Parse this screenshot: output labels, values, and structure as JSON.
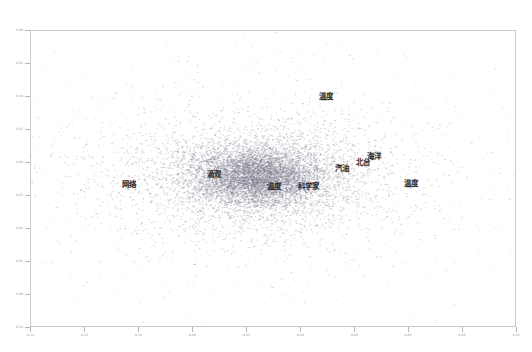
{
  "figure": {
    "background_color": "#ffffff",
    "frame_color": "#c9c9c9",
    "point_color": "#7a7a8c",
    "label_color": "#2b2b2b",
    "tick_color": "#9a9a9a"
  },
  "chart_data": {
    "type": "scatter",
    "title": "",
    "xlabel": "",
    "ylabel": "",
    "grid": false,
    "legend": null,
    "xlim": [
      -0.14,
      0.04
    ],
    "ylim": [
      -0.1,
      0.08
    ],
    "xticks": [
      -0.14,
      -0.12,
      -0.1,
      -0.08,
      -0.06,
      -0.04,
      -0.02,
      0.0,
      0.02,
      0.04
    ],
    "xticklabels": [
      "-0.14",
      "-0.12",
      "-0.10",
      "-0.08",
      "-0.06",
      "-0.04",
      "-0.02",
      "0.00",
      "0.02",
      "0.04"
    ],
    "yticks": [
      -0.1,
      -0.08,
      -0.06,
      -0.04,
      -0.02,
      0.0,
      0.02,
      0.04,
      0.06,
      0.08
    ],
    "yticklabels": [
      "-0.10",
      "-0.08",
      "-0.06",
      "-0.04",
      "-0.02",
      "0.00",
      "0.02",
      "0.04",
      "0.06",
      "0.08"
    ],
    "point_count": 9000,
    "marker_size": 0.6,
    "annotations": [
      {
        "text": "温度",
        "x": -0.0305,
        "y": 0.0395
      },
      {
        "text": "汽油",
        "x": -0.0245,
        "y": -0.004
      },
      {
        "text": "海洋",
        "x": -0.0125,
        "y": 0.003
      },
      {
        "text": "北台",
        "x": -0.0165,
        "y": -0.0005
      },
      {
        "text": "温度",
        "x": 0.001,
        "y": -0.0135
      },
      {
        "text": "网络",
        "x": -0.1035,
        "y": -0.014
      },
      {
        "text": "滴观",
        "x": -0.072,
        "y": -0.008
      },
      {
        "text": "温度",
        "x": -0.0495,
        "y": -0.015
      },
      {
        "text": "科学家",
        "x": -0.037,
        "y": -0.015
      }
    ]
  },
  "axes": {
    "x_tick_labels": [
      "-0.14",
      "-0.12",
      "-0.10",
      "-0.08",
      "-0.06",
      "-0.04",
      "-0.02",
      "0.00",
      "0.02",
      "0.04"
    ],
    "y_tick_labels": [
      "0.08",
      "0.06",
      "0.04",
      "0.02",
      "0.00",
      "-0.02",
      "-0.04",
      "-0.06",
      "-0.08",
      "-0.10"
    ]
  },
  "labels": [
    {
      "text": "温度"
    },
    {
      "text": "汽油"
    },
    {
      "text": "海洋"
    },
    {
      "text": "北台"
    },
    {
      "text": "温度"
    },
    {
      "text": "网络"
    },
    {
      "text": "滴观"
    },
    {
      "text": "温度"
    },
    {
      "text": "科学家"
    }
  ]
}
